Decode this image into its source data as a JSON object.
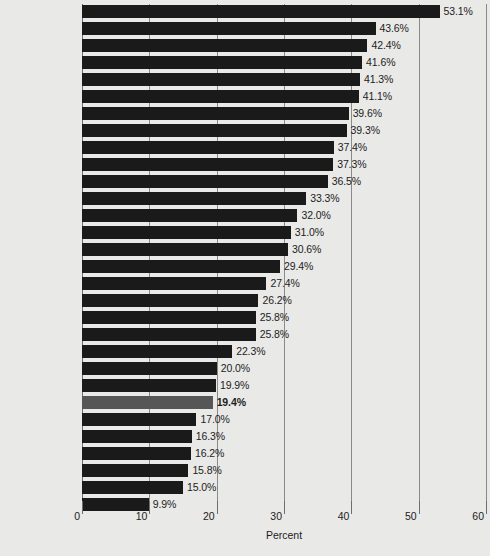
{
  "chart_data": {
    "type": "bar",
    "orientation": "horizontal",
    "title": "",
    "xlabel": "Percent",
    "ylabel": "",
    "xlim": [
      0,
      60
    ],
    "xticks": [
      0,
      10,
      20,
      30,
      40,
      50,
      60
    ],
    "xtick_labels": [
      "0",
      "10",
      "20",
      "30",
      "40",
      "50",
      "60"
    ],
    "grid": true,
    "legend": "none",
    "value_suffix": "%",
    "colors": {
      "bar": "#1a1a1a",
      "bar_highlight": "#565656",
      "background": "#e9e9e7",
      "gridline": "#8a8a88",
      "text": "#1c1c1c"
    },
    "highlight_category": "United States",
    "categories": [
      "Bolivia",
      "Sweden",
      "Mexico",
      "Ecuador",
      "Nicaragua",
      "Spain",
      "Norway",
      "Belgium",
      "Denmark",
      "Netherlands",
      "Germany",
      "Costa Rica",
      "Switzerland",
      "Italy",
      "Austria",
      "United Kingdom",
      "Poland",
      "France",
      "Canada",
      "Honduras",
      "Peru",
      "Czech Republic",
      "Colombia",
      "United States",
      "Venezuela",
      "Ireland",
      "Uruguay",
      "Chile",
      "Paraguay",
      "Brazil"
    ],
    "values": [
      53.1,
      43.6,
      42.4,
      41.6,
      41.3,
      41.1,
      39.6,
      39.3,
      37.4,
      37.3,
      36.5,
      33.3,
      32.0,
      31.0,
      30.6,
      29.4,
      27.4,
      26.2,
      25.8,
      25.8,
      22.3,
      20.0,
      19.9,
      19.4,
      17.0,
      16.3,
      16.2,
      15.8,
      15.0,
      9.9
    ],
    "value_labels": [
      "53.1%",
      "43.6%",
      "42.4%",
      "41.6%",
      "41.3%",
      "41.1%",
      "39.6%",
      "39.3%",
      "37.4%",
      "37.3%",
      "36.5%",
      "33.3%",
      "32.0%",
      "31.0%",
      "30.6%",
      "29.4%",
      "27.4%",
      "26.2%",
      "25.8%",
      "25.8%",
      "22.3%",
      "20.0%",
      "19.9%",
      "19.4%",
      "17.0%",
      "16.3%",
      "16.2%",
      "15.8%",
      "15.0%",
      "9.9%"
    ]
  }
}
